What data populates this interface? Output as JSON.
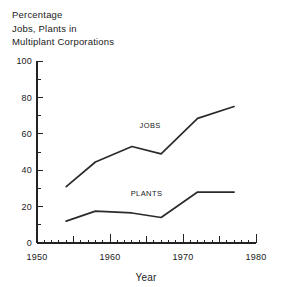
{
  "chart_data": {
    "type": "line",
    "title": "Percentage Jobs, Plants in Multiplant Corporations",
    "title_lines": [
      "Percentage",
      "Jobs, Plants in",
      "Multiplant Corporations"
    ],
    "xlabel": "Year",
    "ylabel": "",
    "xlim": [
      1950,
      1980
    ],
    "ylim": [
      0,
      100
    ],
    "grid": false,
    "legend_position": "inline-annotation",
    "x_ticks_major": [
      1950,
      1960,
      1970,
      1980
    ],
    "x_tick_labels": [
      "1950",
      "1960",
      "1970",
      "1980"
    ],
    "x_ticks_minor_step": 1,
    "x_ticks_medium": [
      1955,
      1965,
      1975
    ],
    "y_ticks_major": [
      0,
      20,
      40,
      60,
      80,
      100
    ],
    "y_tick_labels": [
      "0",
      "20",
      "40",
      "60",
      "80",
      "100"
    ],
    "y_ticks_minor": [
      10,
      30,
      50,
      70,
      90
    ],
    "series": [
      {
        "name": "JOBS",
        "label": "JOBS",
        "label_x": 1965.5,
        "label_y": 63,
        "x": [
          1954,
          1958,
          1963,
          1967,
          1972,
          1977
        ],
        "values": [
          31,
          44.5,
          53,
          49,
          68.5,
          75
        ]
      },
      {
        "name": "PLANTS",
        "label": "PLANTS",
        "label_x": 1965.0,
        "label_y": 26,
        "x": [
          1954,
          1958,
          1963,
          1967,
          1972,
          1977
        ],
        "values": [
          12,
          17.5,
          16.5,
          14,
          28,
          28
        ]
      }
    ],
    "colors": {
      "line": "#2b2b2b",
      "axis": "#222222",
      "text": "#1a1a1a",
      "background": "#ffffff"
    }
  }
}
